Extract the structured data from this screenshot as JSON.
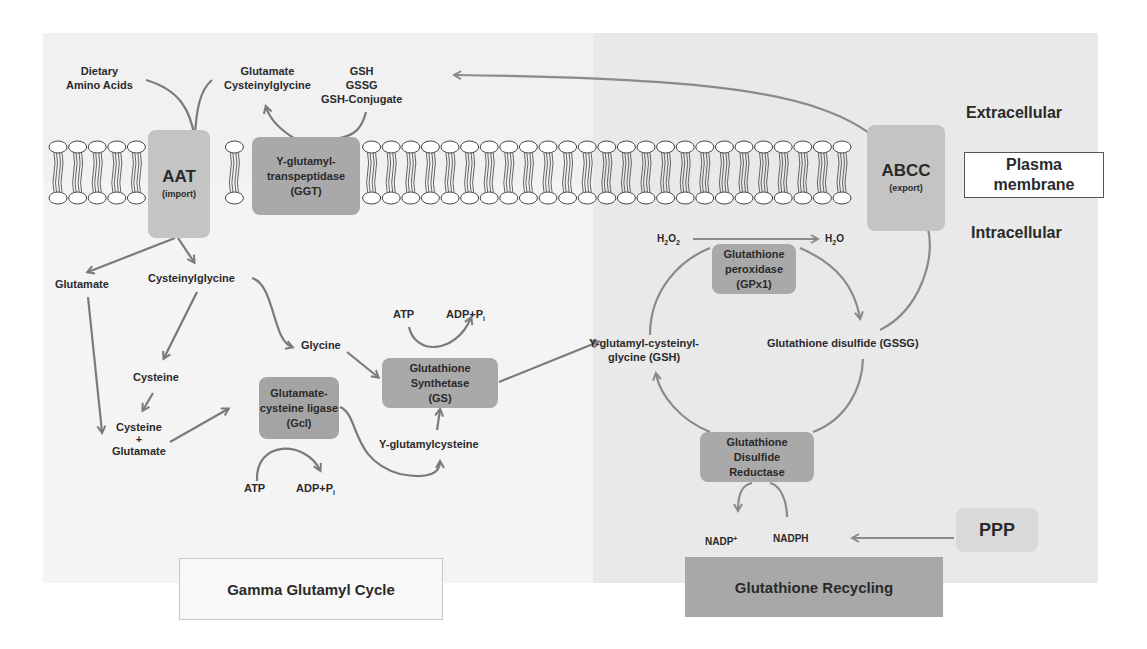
{
  "diagram": {
    "regions": {
      "extracellular": "Extracellular",
      "intracellular": "Intracellular",
      "plasma_membrane_line1": "Plasma",
      "plasma_membrane_line2": "membrane"
    },
    "transporters": {
      "aat": {
        "name": "AAT",
        "sub": "(import)"
      },
      "abcc": {
        "name": "ABCC",
        "sub": "(export)"
      }
    },
    "enzymes": {
      "ggt": [
        "Y-glutamyl-",
        "transpeptidase",
        "(GGT)"
      ],
      "gcl": [
        "Glutamate-",
        "cysteine ligase",
        "(Gcl)"
      ],
      "gs": [
        "Glutathione",
        "Synthetase",
        "(GS)"
      ],
      "gpx": [
        "Glutathione",
        "peroxidase",
        "(GPx1)"
      ],
      "gr": [
        "Glutathione",
        "Disulfide",
        "Reductase"
      ],
      "ppp": "PPP"
    },
    "metabolites": {
      "dietary": [
        "Dietary",
        "Amino Acids"
      ],
      "glu_cysgly": [
        "Glutamate",
        "Cysteinylglycine"
      ],
      "gsh_list": [
        "GSH",
        "GSSG",
        "GSH-Conjugate"
      ],
      "glutamate": "Glutamate",
      "cysteinylglycine": "Cysteinylglycine",
      "cysteine": "Cysteine",
      "cys_glu": [
        "Cysteine",
        "+",
        "Glutamate"
      ],
      "glycine": "Glycine",
      "atp1": "ATP",
      "adp1": "ADP+P",
      "adp1_sub": "i",
      "atp2": "ATP",
      "adp2": "ADP+P",
      "adp2_sub": "i",
      "gamma_glu_cys": "Y-glutamylcysteine",
      "gsh": [
        "Y-glutamyl-cysteinyl-",
        "glycine (GSH)"
      ],
      "gssg": "Glutathione disulfide (GSSG)",
      "h2o2": [
        "H",
        "2",
        "O",
        "2"
      ],
      "h2o": [
        "H",
        "2",
        "O"
      ],
      "nadp": "NADP",
      "nadp_sup": "+",
      "nadph": "NADPH"
    },
    "legends": {
      "gamma_cycle": "Gamma Glutamyl Cycle",
      "recycling": "Glutathione Recycling"
    },
    "colors": {
      "arrow": "#7a7a7a",
      "enzyme_box": "#a9a9a9",
      "transporter_box": "#c4c4c4",
      "right_panel": "#e9e9e9",
      "left_panel": "#f3f3f3"
    }
  }
}
